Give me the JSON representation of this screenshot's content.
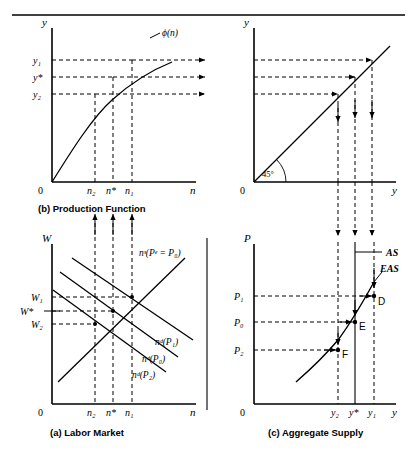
{
  "figure": {
    "title": "",
    "panels": {
      "b": {
        "caption": "(b) Production Function",
        "y_axis_label": "y",
        "x_axis_label": "n",
        "origin_label": "0",
        "curve_label": "ϕ(n)",
        "y_ticks": [
          "y₁",
          "y*",
          "y₂"
        ],
        "x_ticks": [
          "n₂",
          "n*",
          "n₁"
        ]
      },
      "topright": {
        "caption": "",
        "y_axis_label": "y",
        "x_axis_label": "y",
        "origin_label": "0",
        "angle_label": "45°"
      },
      "a": {
        "caption": "(a) Labor Market",
        "y_axis_label": "W",
        "x_axis_label": "n",
        "origin_label": "0",
        "y_ticks": [
          "W₁",
          "W*",
          "W₂"
        ],
        "x_ticks": [
          "n₂",
          "n*",
          "n₁"
        ],
        "supply_label": "nˢ(Pᵉ = P₀)",
        "demand_labels": [
          "nᵈ(P₁)",
          "nᵈ(P₀)",
          "nᵈ(P₂)"
        ]
      },
      "c": {
        "caption": "(c) Aggregate Supply",
        "y_axis_label": "P",
        "x_axis_label": "y",
        "origin_label": "0",
        "y_ticks": [
          "P₁",
          "P₀",
          "P₂"
        ],
        "x_ticks": [
          "y₂",
          "y*",
          "y₁"
        ],
        "as_label": "AS",
        "eas_label": "EAS",
        "points": [
          "D",
          "E",
          "F"
        ]
      }
    },
    "colors": {
      "ink": "#000000",
      "background": "#ffffff",
      "dashed": "#000000"
    }
  }
}
